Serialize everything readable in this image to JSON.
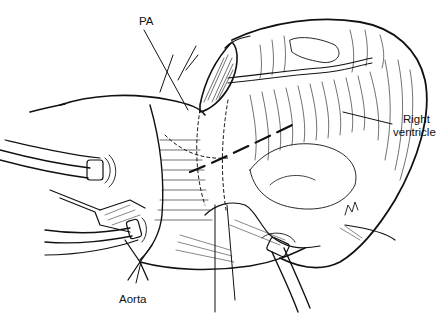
{
  "figure": {
    "type": "surgical illustration",
    "colors": {
      "ink": "#111111",
      "background": "#ffffff"
    }
  },
  "labels": {
    "pa": "PA",
    "right_ventricle_line1": "Right",
    "right_ventricle_line2": "ventricle",
    "aorta": "Aorta"
  }
}
